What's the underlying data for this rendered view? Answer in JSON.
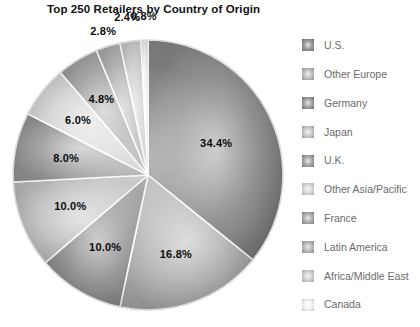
{
  "chart_data": {
    "type": "pie",
    "title": "Top 250 Retailers by Country of Origin",
    "xlabel": "",
    "ylabel": "",
    "legend_position": "right",
    "grid": false,
    "units": "percent",
    "categories": [
      "U.S.",
      "Other Europe",
      "Germany",
      "Japan",
      "U.K.",
      "Other Asia/Pacific",
      "France",
      "Latin America",
      "Africa/Middle East",
      "Canada"
    ],
    "values": [
      34.4,
      16.8,
      10.0,
      10.0,
      8.0,
      6.0,
      4.8,
      2.8,
      2.4,
      0.8
    ],
    "value_labels": [
      "34.4%",
      "16.8%",
      "10.0%",
      "10.0%",
      "8.0%",
      "6.0%",
      "4.8%",
      "2.8%",
      "2.4%",
      "0.8%"
    ],
    "slice_colors": [
      "#808080",
      "#b0b0b0",
      "#888888",
      "#bdbdbd",
      "#909090",
      "#d2d2d2",
      "#9a9a9a",
      "#a8a8a8",
      "#c8c8c8",
      "#f2f2f2"
    ],
    "separator_color": "#ffffff",
    "start_angle_deg": 0,
    "direction": "clockwise"
  },
  "title": {
    "text": "Top 250 Retailers by Country of Origin"
  },
  "legend": {
    "items": [
      {
        "label": "U.S.",
        "color": "#808080",
        "value": "34.4%"
      },
      {
        "label": "Other Europe",
        "color": "#b0b0b0",
        "value": "16.8%"
      },
      {
        "label": "Germany",
        "color": "#888888",
        "value": "10.0%"
      },
      {
        "label": "Japan",
        "color": "#bdbdbd",
        "value": "10.0%"
      },
      {
        "label": "U.K.",
        "color": "#909090",
        "value": "8.0%"
      },
      {
        "label": "Other Asia/Pacific",
        "color": "#d2d2d2",
        "value": "6.0%"
      },
      {
        "label": "France",
        "color": "#9a9a9a",
        "value": "4.8%"
      },
      {
        "label": "Latin America",
        "color": "#a8a8a8",
        "value": "2.8%"
      },
      {
        "label": "Africa/Middle East",
        "color": "#c8c8c8",
        "value": "2.4%"
      },
      {
        "label": "Canada",
        "color": "#f2f2f2",
        "value": "0.8%"
      }
    ]
  }
}
